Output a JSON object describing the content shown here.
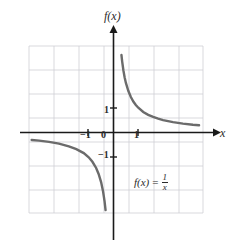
{
  "figure": {
    "title": "",
    "background_color": "#ffffff"
  },
  "labels": {
    "y_axis": "f(x)",
    "x_axis": "x",
    "equation_lhs": "f(x)",
    "equation_sign": "=",
    "equation_numerator": "1",
    "equation_denominator": "x"
  },
  "ticks": {
    "x_neg1": "−1",
    "x_0": "0",
    "x_1": "1",
    "y_1": "1",
    "y_neg1": "−1"
  },
  "colors": {
    "curve": "#6b6b6b",
    "axis": "#1a1a1a",
    "grid": "#cfcfd4",
    "text": "#2b2b2b",
    "background": "#ffffff"
  },
  "chart_data": {
    "type": "line",
    "title": "",
    "subtitle": "",
    "xlabel": "x",
    "ylabel": "f(x)",
    "xlim": [
      -3.4,
      3.6
    ],
    "ylim": [
      -3.4,
      3.4
    ],
    "grid": true,
    "grid_spacing": 1,
    "legend": null,
    "axis_arrows": [
      "x-positive",
      "y-positive"
    ],
    "xticks": [
      -1,
      0,
      1
    ],
    "xticklabels": [
      "−1",
      "0",
      "1"
    ],
    "yticks": [
      -1,
      1
    ],
    "yticklabels": [
      "−1",
      "1"
    ],
    "annotations": [
      {
        "text": "f(x) = 1/x",
        "x": 1.7,
        "y": -2.0
      }
    ],
    "series": [
      {
        "name": "f(x) = 1/x (branch x > 0)",
        "equation": "y = 1/x",
        "color": "#6b6b6b",
        "linewidth": 2.4,
        "x": [
          0.32,
          0.35,
          0.4,
          0.45,
          0.5,
          0.6,
          0.7,
          0.8,
          0.9,
          1.0,
          1.2,
          1.4,
          1.6,
          1.8,
          2.0,
          2.4,
          2.8,
          3.2,
          3.45
        ],
        "y": [
          3.13,
          2.86,
          2.5,
          2.22,
          2.0,
          1.67,
          1.43,
          1.25,
          1.11,
          1.0,
          0.83,
          0.71,
          0.63,
          0.56,
          0.5,
          0.42,
          0.36,
          0.31,
          0.29
        ]
      },
      {
        "name": "f(x) = 1/x (branch x < 0)",
        "equation": "y = 1/x",
        "color": "#6b6b6b",
        "linewidth": 2.4,
        "x": [
          -3.3,
          -3.0,
          -2.6,
          -2.2,
          -1.8,
          -1.5,
          -1.2,
          -1.0,
          -0.85,
          -0.7,
          -0.6,
          -0.5,
          -0.42,
          -0.36,
          -0.32
        ],
        "y": [
          -0.3,
          -0.33,
          -0.38,
          -0.45,
          -0.56,
          -0.67,
          -0.83,
          -1.0,
          -1.18,
          -1.43,
          -1.67,
          -2.0,
          -2.38,
          -2.78,
          -3.13
        ]
      }
    ]
  }
}
